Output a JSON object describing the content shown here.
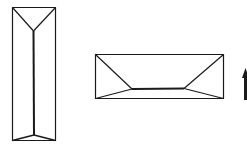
{
  "diagram": {
    "stroke_color": "#1a1a1a",
    "background": "#ffffff",
    "shapes": [
      {
        "name": "tall-prism",
        "type": "rectangle-with-ridge"
      },
      {
        "name": "wide-prism",
        "type": "rectangle-with-ridge"
      },
      {
        "name": "up-arrow",
        "type": "arrow",
        "direction": "up"
      }
    ]
  }
}
